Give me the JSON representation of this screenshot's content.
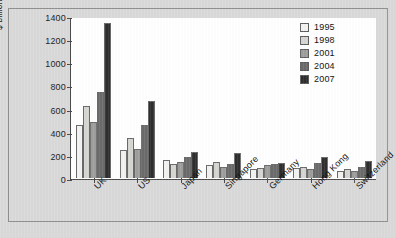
{
  "chart_data": {
    "type": "bar",
    "title": "",
    "xlabel": "",
    "ylabel": "$ billion",
    "ylim": [
      0,
      1400
    ],
    "yticks": [
      0,
      200,
      400,
      600,
      800,
      1000,
      1200,
      1400
    ],
    "grid": false,
    "legend_position": "top-right",
    "categories": [
      "UK",
      "US",
      "Japan",
      "Singapore",
      "Germany",
      "Hong Kong",
      "Switzerland"
    ],
    "series": [
      {
        "name": "1995",
        "color": "#f2f2f0",
        "values": [
          460,
          240,
          160,
          115,
          75,
          85,
          65
        ]
      },
      {
        "name": "1998",
        "color": "#d5d5d2",
        "values": [
          630,
          350,
          125,
          135,
          85,
          95,
          75
        ]
      },
      {
        "name": "2001",
        "color": "#9e9e9c",
        "values": [
          490,
          250,
          140,
          95,
          110,
          80,
          60
        ]
      },
      {
        "name": "2004",
        "color": "#6b6b6b",
        "values": [
          750,
          460,
          180,
          120,
          120,
          130,
          100
        ]
      },
      {
        "name": "2007",
        "color": "#2e2e2e",
        "values": [
          1350,
          670,
          230,
          215,
          130,
          185,
          150
        ]
      }
    ]
  },
  "figure": {
    "background_color": "#d9d9d9",
    "plot_background_color": "#ffffff",
    "frame_color": "#8e8e8e",
    "axis_color": "#4a4a4a"
  }
}
